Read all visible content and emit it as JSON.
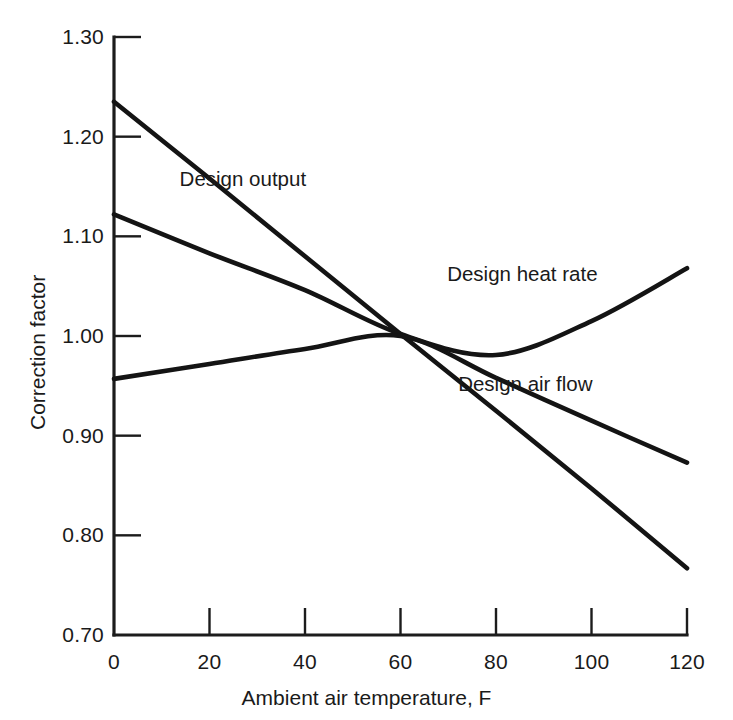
{
  "chart_data": {
    "type": "line",
    "title": "",
    "xlabel": "Ambient air temperature, F",
    "ylabel": "Correction factor",
    "xlim": [
      0,
      120
    ],
    "ylim": [
      0.7,
      1.3
    ],
    "grid": false,
    "legend_position": "inline-labels",
    "xticks": [
      "0",
      "20",
      "40",
      "60",
      "80",
      "100",
      "120"
    ],
    "xtick_values": [
      0,
      20,
      40,
      60,
      80,
      100,
      120
    ],
    "yticks": [
      "0.70",
      "0.80",
      "0.90",
      "1.00",
      "1.10",
      "1.20",
      "1.30"
    ],
    "ytick_values": [
      0.7,
      0.8,
      0.9,
      1.0,
      1.1,
      1.2,
      1.3
    ],
    "x": [
      0,
      20,
      40,
      60,
      80,
      100,
      120
    ],
    "series": [
      {
        "name": "Design output",
        "label": "Design output",
        "values": [
          1.235,
          1.158,
          1.08,
          1.002,
          0.925,
          0.847,
          0.767
        ],
        "label_x_pct": 24.5,
        "label_y_pct": 23.2
      },
      {
        "name": "Design heat rate",
        "label": "Design heat rate",
        "values": [
          1.122,
          1.083,
          1.046,
          1.002,
          0.981,
          1.015,
          1.068
        ],
        "label_x_pct": 61.0,
        "label_y_pct": 36.4
      },
      {
        "name": "Design air flow",
        "label": "Design air flow",
        "values": [
          0.957,
          0.972,
          0.987,
          1.0,
          0.958,
          0.915,
          0.873
        ],
        "label_x_pct": 62.5,
        "label_y_pct": 51.7
      }
    ]
  },
  "annotations": {
    "crossing_point": "All three curves intersect near 60 F, 1.00"
  }
}
